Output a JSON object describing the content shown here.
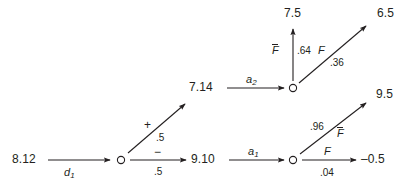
{
  "diagram": {
    "type": "decision-tree",
    "stroke_color": "#231f20",
    "background": "#ffffff",
    "nodes": [
      {
        "id": "root",
        "label": "8.12",
        "x": 28,
        "y": 160,
        "kind": "value"
      },
      {
        "id": "node-d1",
        "label": "",
        "x": 120,
        "y": 160,
        "kind": "circle"
      },
      {
        "id": "node-910",
        "label": "9.10",
        "x": 205,
        "y": 160,
        "kind": "value"
      },
      {
        "id": "node-a1",
        "label": "",
        "x": 293,
        "y": 160,
        "kind": "circle"
      },
      {
        "id": "node-714",
        "label": "7.14",
        "x": 203,
        "y": 88,
        "kind": "value"
      },
      {
        "id": "node-a2",
        "label": "",
        "x": 293,
        "y": 88,
        "kind": "circle"
      },
      {
        "id": "leaf-75",
        "label": "7.5",
        "x": 276,
        "y": 14,
        "kind": "value"
      },
      {
        "id": "leaf-65",
        "label": "6.5",
        "x": 382,
        "y": 14,
        "kind": "value"
      },
      {
        "id": "leaf-95",
        "label": "9.5",
        "x": 381,
        "y": 95,
        "kind": "value"
      },
      {
        "id": "leaf-neg05",
        "label": "–0.5",
        "x": 372,
        "y": 160,
        "kind": "value"
      }
    ],
    "edges": [
      {
        "id": "edge-d1",
        "from": "root",
        "to": "node-d1",
        "label": "d",
        "subscript": "1",
        "probability": ""
      },
      {
        "id": "edge-plus",
        "from": "node-d1",
        "to": "node-714",
        "label": "+",
        "subscript": "",
        "probability": ".5"
      },
      {
        "id": "edge-minus",
        "from": "node-d1",
        "to": "node-910",
        "label": "−",
        "subscript": "",
        "probability": ".5"
      },
      {
        "id": "edge-a2",
        "from": "node-714",
        "to": "node-a2",
        "label": "a",
        "subscript": "2",
        "probability": ""
      },
      {
        "id": "edge-fbar-64",
        "from": "node-a2",
        "to": "leaf-75",
        "label": "F",
        "overbar": true,
        "probability": ".64"
      },
      {
        "id": "edge-f-36",
        "from": "node-a2",
        "to": "leaf-65",
        "label": "F",
        "overbar": false,
        "probability": ".36"
      },
      {
        "id": "edge-a1",
        "from": "node-910",
        "to": "node-a1",
        "label": "a",
        "subscript": "1",
        "probability": ""
      },
      {
        "id": "edge-fbar-96",
        "from": "node-a1",
        "to": "leaf-95",
        "label": "F",
        "overbar": true,
        "probability": ".96"
      },
      {
        "id": "edge-f-04",
        "from": "node-a1",
        "to": "leaf-neg05",
        "label": "F",
        "overbar": false,
        "probability": ".04"
      }
    ],
    "labels": {
      "root_value": "8.12",
      "value_910": "9.10",
      "value_714": "7.14",
      "leaf_75": "7.5",
      "leaf_65": "6.5",
      "leaf_95": "9.5",
      "leaf_neg05": "–0.5",
      "d_symbol": "d",
      "d_sub": "1",
      "a1_symbol": "a",
      "a1_sub": "1",
      "a2_symbol": "a",
      "a2_sub": "2",
      "plus_symbol": "+",
      "minus_symbol": "−",
      "prob_plus": ".5",
      "prob_minus": ".5",
      "f_symbol": "F",
      "prob_64": ".64",
      "prob_36": ".36",
      "prob_96": ".96",
      "prob_04": ".04"
    }
  }
}
